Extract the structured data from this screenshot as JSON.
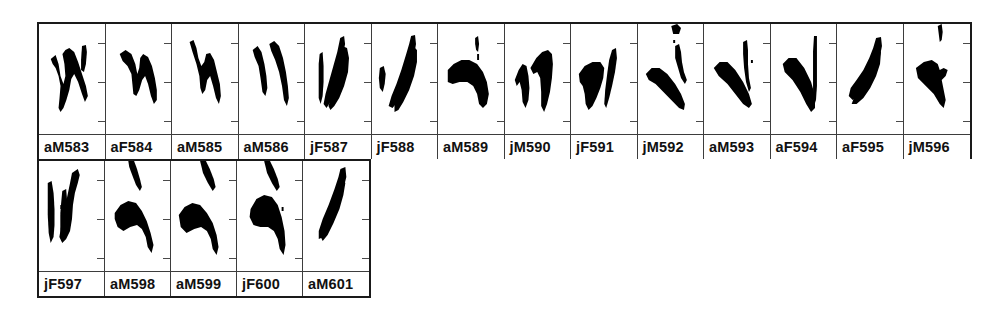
{
  "figure": {
    "type": "spectrogram-panel-grid",
    "panel_count": 19,
    "ink_color": "#000000",
    "border_color": "#1a1a1a",
    "background_color": "#ffffff",
    "rows": [
      {
        "row_index": 1,
        "panels": [
          {
            "label": "aM583"
          },
          {
            "label": "aF584"
          },
          {
            "label": "aM585"
          },
          {
            "label": "aM586"
          },
          {
            "label": "jF587"
          },
          {
            "label": "jF588"
          },
          {
            "label": "aM589"
          },
          {
            "label": "jM590"
          },
          {
            "label": "jF591"
          },
          {
            "label": "jM592"
          },
          {
            "label": "aM593"
          },
          {
            "label": "aF594"
          },
          {
            "label": "aF595"
          },
          {
            "label": "jM596"
          }
        ]
      },
      {
        "row_index": 2,
        "panels": [
          {
            "label": "jF597"
          },
          {
            "label": "aM598"
          },
          {
            "label": "aM599"
          },
          {
            "label": "jF600"
          },
          {
            "label": "aM601"
          }
        ]
      }
    ],
    "tick_positions": 3
  }
}
